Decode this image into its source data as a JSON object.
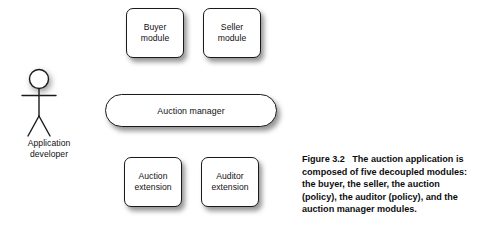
{
  "figure": {
    "background_color": "#ffffff",
    "stroke_color": "#1a1a1a",
    "text_color": "#111111"
  },
  "actor": {
    "icon": "stick-figure-actor-icon",
    "label": "Application\ndeveloper"
  },
  "modules": {
    "top_row": [
      {
        "id": "buyer-module",
        "label": "Buyer\nmodule"
      },
      {
        "id": "seller-module",
        "label": "Seller\nmodule"
      }
    ],
    "middle": {
      "id": "auction-manager",
      "label": "Auction manager"
    },
    "bottom_row": [
      {
        "id": "auction-extension",
        "label": "Auction\nextension"
      },
      {
        "id": "auditor-extension",
        "label": "Auditor\nextension"
      }
    ]
  },
  "caption": {
    "lines": [
      "Figure 3.2   The auction application is",
      "composed of five decoupled modules:",
      "the buyer, the seller, the auction",
      "(policy), the auditor (policy), and the",
      "auction manager modules."
    ],
    "line1": "Figure 3.2   The auction application is",
    "line2": "composed of five decoupled modules:",
    "line3": "the buyer, the seller, the auction",
    "line4": "(policy), the auditor (policy), and the",
    "line5": "auction manager modules."
  }
}
